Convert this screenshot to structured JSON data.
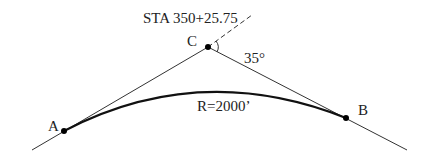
{
  "diagram": {
    "station_label": "STA 350+25.75",
    "points": {
      "A": {
        "label": "A"
      },
      "B": {
        "label": "B"
      },
      "C": {
        "label": "C"
      }
    },
    "deflection_angle": "35°",
    "radius_label": "R=2000’",
    "colors": {
      "line": "#222222",
      "background": "#ffffff"
    }
  }
}
